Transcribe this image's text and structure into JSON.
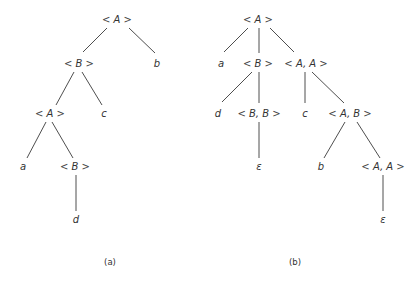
{
  "trees": {
    "a": {
      "caption": "(a)",
      "nodes": [
        {
          "id": "a_root",
          "label": "A",
          "x": 117,
          "y": 23,
          "type": "nonterminal"
        },
        {
          "id": "a_B1",
          "label": "B",
          "x": 79,
          "y": 67,
          "type": "nonterminal"
        },
        {
          "id": "a_b",
          "label": "b",
          "x": 157,
          "y": 67,
          "type": "terminal"
        },
        {
          "id": "a_A2",
          "label": "A",
          "x": 50,
          "y": 117,
          "type": "nonterminal"
        },
        {
          "id": "a_c",
          "label": "c",
          "x": 104,
          "y": 117,
          "type": "terminal"
        },
        {
          "id": "a_a",
          "label": "a",
          "x": 23,
          "y": 170,
          "type": "terminal"
        },
        {
          "id": "a_B2",
          "label": "B",
          "x": 75,
          "y": 170,
          "type": "nonterminal"
        },
        {
          "id": "a_d",
          "label": "d",
          "x": 76,
          "y": 223,
          "type": "terminal"
        }
      ],
      "edges": [
        {
          "x1": 107,
          "y1": 28,
          "x2": 83,
          "y2": 52
        },
        {
          "x1": 129,
          "y1": 28,
          "x2": 155,
          "y2": 53
        },
        {
          "x1": 74,
          "y1": 72,
          "x2": 56,
          "y2": 105
        },
        {
          "x1": 82,
          "y1": 72,
          "x2": 102,
          "y2": 105
        },
        {
          "x1": 46,
          "y1": 122,
          "x2": 27,
          "y2": 158
        },
        {
          "x1": 52,
          "y1": 122,
          "x2": 73,
          "y2": 158
        },
        {
          "x1": 76,
          "y1": 175,
          "x2": 76,
          "y2": 211
        }
      ]
    },
    "b": {
      "caption": "(b)",
      "nodes": [
        {
          "id": "b_root",
          "label": "A",
          "x": 258,
          "y": 23,
          "type": "nonterminal"
        },
        {
          "id": "b_a",
          "label": "a",
          "x": 221,
          "y": 67,
          "type": "terminal"
        },
        {
          "id": "b_B",
          "label": "B",
          "x": 258,
          "y": 67,
          "type": "nonterminal"
        },
        {
          "id": "b_AA1",
          "label": "A, A",
          "x": 306,
          "y": 67,
          "type": "nonterminal"
        },
        {
          "id": "b_d",
          "label": "d",
          "x": 218,
          "y": 117,
          "type": "terminal"
        },
        {
          "id": "b_BB",
          "label": "B, B",
          "x": 259,
          "y": 117,
          "type": "nonterminal"
        },
        {
          "id": "b_c",
          "label": "c",
          "x": 305,
          "y": 117,
          "type": "terminal"
        },
        {
          "id": "b_AB",
          "label": "A, B",
          "x": 350,
          "y": 117,
          "type": "nonterminal"
        },
        {
          "id": "b_eps1",
          "label": "ε",
          "x": 259,
          "y": 170,
          "type": "terminal"
        },
        {
          "id": "b_b",
          "label": "b",
          "x": 321,
          "y": 170,
          "type": "terminal"
        },
        {
          "id": "b_AA2",
          "label": "A, A",
          "x": 383,
          "y": 170,
          "type": "nonterminal"
        },
        {
          "id": "b_eps2",
          "label": "ε",
          "x": 383,
          "y": 223,
          "type": "terminal"
        }
      ],
      "edges": [
        {
          "x1": 248,
          "y1": 28,
          "x2": 224,
          "y2": 52
        },
        {
          "x1": 259,
          "y1": 28,
          "x2": 259,
          "y2": 53
        },
        {
          "x1": 270,
          "y1": 28,
          "x2": 294,
          "y2": 52
        },
        {
          "x1": 252,
          "y1": 72,
          "x2": 222,
          "y2": 102
        },
        {
          "x1": 259,
          "y1": 72,
          "x2": 259,
          "y2": 103
        },
        {
          "x1": 305,
          "y1": 72,
          "x2": 305,
          "y2": 103
        },
        {
          "x1": 312,
          "y1": 72,
          "x2": 344,
          "y2": 103
        },
        {
          "x1": 259,
          "y1": 122,
          "x2": 259,
          "y2": 158
        },
        {
          "x1": 345,
          "y1": 122,
          "x2": 324,
          "y2": 158
        },
        {
          "x1": 357,
          "y1": 122,
          "x2": 380,
          "y2": 158
        },
        {
          "x1": 383,
          "y1": 175,
          "x2": 383,
          "y2": 211
        }
      ]
    }
  },
  "captions": {
    "a": {
      "text": "(a)",
      "x": 110,
      "y": 265
    },
    "b": {
      "text": "(b)",
      "x": 295,
      "y": 265
    }
  }
}
